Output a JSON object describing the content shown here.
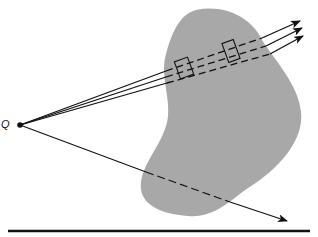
{
  "diagram": {
    "point_label": "Q",
    "colors": {
      "region_fill": "#a8a8a8",
      "line": "#111111",
      "background": "#ffffff"
    },
    "elements": [
      {
        "type": "point",
        "label": "Q",
        "x": 20,
        "y": 125
      },
      {
        "type": "region",
        "shape": "irregular-blob",
        "fill": "gray"
      },
      {
        "type": "ray-bundle",
        "count": 3,
        "from": "Q",
        "direction": "upper-right",
        "dashed_inside_region": true,
        "boxes_on_bundle": 2
      },
      {
        "type": "ray",
        "count": 1,
        "from": "Q",
        "direction": "lower-right",
        "dashed_inside_region": true
      },
      {
        "type": "baseline",
        "y": 231
      }
    ]
  }
}
